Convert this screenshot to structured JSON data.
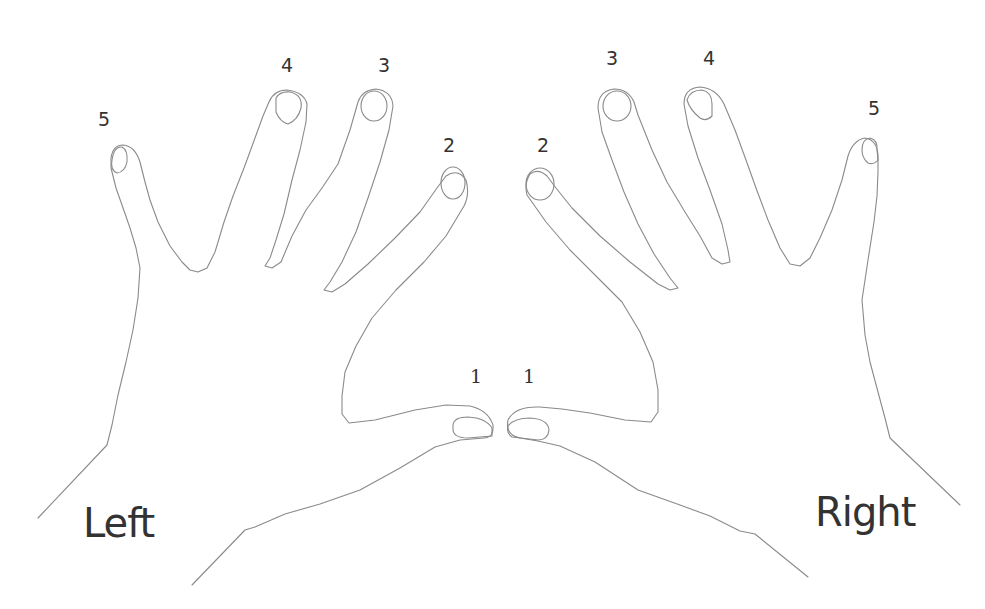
{
  "diagram": {
    "type": "finger-numbering",
    "stroke_color": "#8a8a8a",
    "text_color": "#333333",
    "hands": {
      "left": {
        "name": "Left",
        "fingers": [
          {
            "number": "1",
            "finger": "thumb"
          },
          {
            "number": "2",
            "finger": "index"
          },
          {
            "number": "3",
            "finger": "middle"
          },
          {
            "number": "4",
            "finger": "ring"
          },
          {
            "number": "5",
            "finger": "pinky"
          }
        ]
      },
      "right": {
        "name": "Right",
        "fingers": [
          {
            "number": "1",
            "finger": "thumb"
          },
          {
            "number": "2",
            "finger": "index"
          },
          {
            "number": "3",
            "finger": "middle"
          },
          {
            "number": "4",
            "finger": "ring"
          },
          {
            "number": "5",
            "finger": "pinky"
          }
        ]
      }
    }
  }
}
